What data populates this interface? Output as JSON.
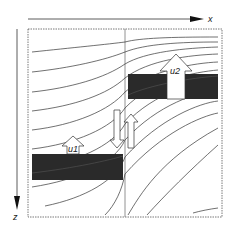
{
  "diagram": {
    "axes": {
      "x_label": "x",
      "z_label": "z"
    },
    "blocks": [
      {
        "name": "left-block",
        "label": "u1"
      },
      {
        "name": "right-block",
        "label": "u2"
      }
    ],
    "colors": {
      "block_fill": "#2a2a2a",
      "line": "#333333",
      "frame": "#555555",
      "background": "#ffffff"
    }
  }
}
